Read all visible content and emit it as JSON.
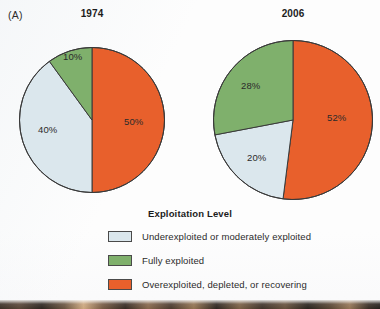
{
  "figure": {
    "panel_letter": "(A)",
    "legend_title": "Exploitation Level"
  },
  "colors": {
    "underexploited": "#dbe7ed",
    "fully_exploited": "#7fb06c",
    "overexploited": "#e8602c",
    "outline": "#3a3a3a",
    "background": "#fdfdfd",
    "text": "#2b2b2b"
  },
  "legend": {
    "title": "Exploitation Level",
    "items": [
      {
        "label": "Underexploited or moderately exploited",
        "color": "#dbe7ed",
        "swatch_name": "underexploited-swatch"
      },
      {
        "label": "Fully exploited",
        "color": "#7fb06c",
        "swatch_name": "fully-exploited-swatch"
      },
      {
        "label": "Overexploited, depleted, or recovering",
        "color": "#e8602c",
        "swatch_name": "overexploited-swatch"
      }
    ]
  },
  "charts": [
    {
      "title": "1974",
      "labels": [
        "50%",
        "40%",
        "10%"
      ]
    },
    {
      "title": "2006",
      "labels": [
        "52%",
        "20%",
        "28%"
      ]
    }
  ],
  "chart_data": [
    {
      "type": "pie",
      "title": "1974",
      "categories": [
        "Overexploited, depleted, or recovering",
        "Underexploited or moderately exploited",
        "Fully exploited"
      ],
      "values": [
        50,
        40,
        10
      ],
      "value_labels": [
        "50%",
        "40%",
        "10%"
      ],
      "unit": "percent",
      "colors": [
        "#e8602c",
        "#dbe7ed",
        "#7fb06c"
      ],
      "start_angle_deg": 0,
      "direction": "clockwise",
      "legend_title": "Exploitation Level",
      "legend_position": "bottom",
      "grid": false,
      "xlabel": "",
      "ylabel": ""
    },
    {
      "type": "pie",
      "title": "2006",
      "categories": [
        "Overexploited, depleted, or recovering",
        "Underexploited or moderately exploited",
        "Fully exploited"
      ],
      "values": [
        52,
        20,
        28
      ],
      "value_labels": [
        "52%",
        "20%",
        "28%"
      ],
      "unit": "percent",
      "colors": [
        "#e8602c",
        "#dbe7ed",
        "#7fb06c"
      ],
      "start_angle_deg": 0,
      "direction": "clockwise",
      "legend_title": "Exploitation Level",
      "legend_position": "bottom",
      "grid": false,
      "xlabel": "",
      "ylabel": ""
    }
  ]
}
